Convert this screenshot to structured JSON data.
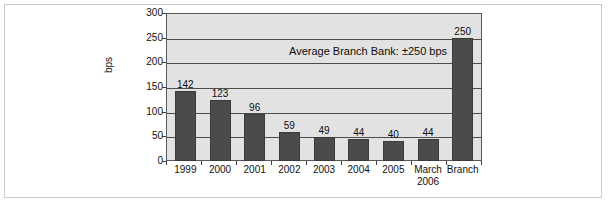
{
  "chart_data": {
    "type": "bar",
    "title": "",
    "subtitle": "",
    "xlabel": "",
    "ylabel": "bps",
    "ylim": [
      0,
      300
    ],
    "ytick_values": [
      300,
      250,
      200,
      150,
      100,
      50,
      0
    ],
    "ytick_labels": [
      "300",
      "250",
      "200",
      "150",
      "100",
      "50",
      "0"
    ],
    "grid": true,
    "grid_orientation": "horizontal",
    "legend": false,
    "legend_position": "none",
    "bar_color": "#4b4b4b",
    "plot_background": "#e2e2e2",
    "categories": [
      "1999",
      "2000",
      "2001",
      "2002",
      "2003",
      "2004",
      "2005",
      "March 2006",
      "Branch"
    ],
    "category_lines": [
      [
        "1999",
        ""
      ],
      [
        "2000",
        ""
      ],
      [
        "2001",
        ""
      ],
      [
        "2002",
        ""
      ],
      [
        "2003",
        ""
      ],
      [
        "2004",
        ""
      ],
      [
        "2005",
        ""
      ],
      [
        "March",
        "2006"
      ],
      [
        "Branch",
        ""
      ]
    ],
    "values": [
      142,
      123,
      96,
      59,
      49,
      44,
      40,
      44,
      250
    ],
    "value_labels": [
      "142",
      "123",
      "96",
      "59",
      "49",
      "44",
      "40",
      "44",
      "250"
    ],
    "annotations": [
      {
        "text": "Average Branch Bank: ±250 bps",
        "value": 250
      }
    ]
  }
}
